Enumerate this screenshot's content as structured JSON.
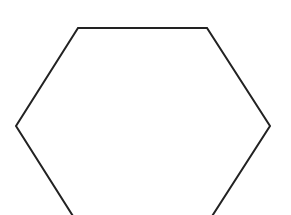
{
  "diagram": {
    "shape": "hexagon",
    "stroke_color": "#222222",
    "fill_color": "#ffffff",
    "background_color": "#ffffff",
    "stroke_width": 2,
    "points": "78,28 207,28 270,126 207,224 78,224 16,126"
  }
}
